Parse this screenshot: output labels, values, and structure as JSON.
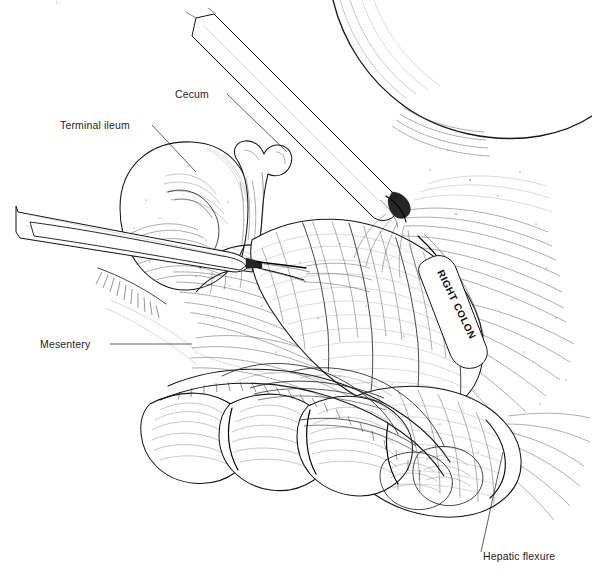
{
  "figure": {
    "kind": "medical-line-illustration",
    "technique": "pen-and-ink stipple and hatch",
    "background_color": "#ffffff",
    "ink_color": "#1a1a1a",
    "width": 592,
    "height": 583
  },
  "labels": [
    {
      "id": "terminal-ileum",
      "text": "Terminal ileum",
      "x": 60,
      "y": 129,
      "anchor": "start",
      "rotation": 0
    },
    {
      "id": "cecum",
      "text": "Cecum",
      "x": 175,
      "y": 98,
      "anchor": "start",
      "rotation": 0
    },
    {
      "id": "mesentery",
      "text": "Mesentery",
      "x": 40,
      "y": 348,
      "anchor": "start",
      "rotation": 0
    },
    {
      "id": "right-colon",
      "text": "RIGHT COLON",
      "x": 437,
      "y": 272,
      "anchor": "start",
      "rotation": 64
    },
    {
      "id": "hepatic-flexure",
      "text": "Hepatic flexure",
      "x": 483,
      "y": 560,
      "anchor": "start",
      "rotation": 0
    }
  ],
  "leader_lines": [
    {
      "id": "leader-terminal-ileum",
      "points": "152,125 196,172"
    },
    {
      "id": "leader-cecum",
      "points": "227,94 287,152"
    },
    {
      "id": "leader-mesentery",
      "points": "110,344 192,344"
    },
    {
      "id": "leader-hepatic-flexure",
      "points": "481,552 503,452"
    }
  ],
  "instruments": [
    {
      "id": "upper-grasper",
      "description": "laparoscopic grasper entering from upper left, tip at colon wall",
      "shaft_angle_deg": 42,
      "tip_x": 402,
      "tip_y": 205
    },
    {
      "id": "lower-grasper",
      "description": "laparoscopic grasper entering from left, jaws on mesentery",
      "shaft_angle_deg": 10,
      "tip_x": 300,
      "tip_y": 262
    }
  ],
  "anatomy": [
    {
      "id": "liver-edge",
      "name": "liver inferior edge"
    },
    {
      "id": "cecum-body",
      "name": "cecum"
    },
    {
      "id": "terminal-ileum-loop",
      "name": "terminal ileum"
    },
    {
      "id": "appendix-stump",
      "name": "appendix / ileocecal junction"
    },
    {
      "id": "ascending-colon",
      "name": "right (ascending) colon"
    },
    {
      "id": "hepatic-flexure-body",
      "name": "hepatic flexure"
    },
    {
      "id": "transverse-colon",
      "name": "transverse colon haustra"
    },
    {
      "id": "mesentery-sheet",
      "name": "divided mesentery"
    },
    {
      "id": "retroperitoneum",
      "name": "retroperitoneal attachments"
    }
  ]
}
